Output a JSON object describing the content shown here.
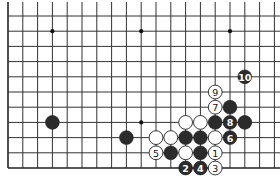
{
  "diagram": {
    "type": "go-board-partial",
    "visible_columns": 19,
    "visible_rows": 11,
    "edges": [
      "left",
      "bottom"
    ],
    "colors": {
      "black_stone": "#2b2b2b",
      "white_stone": "#ffffff",
      "grid": "#333333",
      "background": "#ffffff"
    },
    "star_points": [
      {
        "col": 3,
        "row": 1
      },
      {
        "col": 9,
        "row": 1
      },
      {
        "col": 15,
        "row": 1
      },
      {
        "col": 9,
        "row": 7
      }
    ],
    "stones": [
      {
        "color": "black",
        "col": 3,
        "row": 7,
        "label": ""
      },
      {
        "color": "black",
        "col": 8,
        "row": 8,
        "label": ""
      },
      {
        "color": "black",
        "col": 16,
        "row": 4,
        "label": "10"
      },
      {
        "color": "white",
        "col": 14,
        "row": 5,
        "label": "9"
      },
      {
        "color": "white",
        "col": 14,
        "row": 6,
        "label": "7"
      },
      {
        "color": "black",
        "col": 15,
        "row": 6,
        "label": ""
      },
      {
        "color": "white",
        "col": 12,
        "row": 7,
        "label": ""
      },
      {
        "color": "white",
        "col": 13,
        "row": 7,
        "label": ""
      },
      {
        "color": "black",
        "col": 14,
        "row": 7,
        "label": ""
      },
      {
        "color": "black",
        "col": 15,
        "row": 7,
        "label": "8"
      },
      {
        "color": "black",
        "col": 16,
        "row": 7,
        "label": ""
      },
      {
        "color": "white",
        "col": 10,
        "row": 8,
        "label": ""
      },
      {
        "color": "white",
        "col": 11,
        "row": 8,
        "label": ""
      },
      {
        "color": "black",
        "col": 12,
        "row": 8,
        "label": ""
      },
      {
        "color": "black",
        "col": 13,
        "row": 8,
        "label": ""
      },
      {
        "color": "white",
        "col": 14,
        "row": 8,
        "label": ""
      },
      {
        "color": "black",
        "col": 15,
        "row": 8,
        "label": "6"
      },
      {
        "color": "white",
        "col": 10,
        "row": 9,
        "label": "5"
      },
      {
        "color": "black",
        "col": 11,
        "row": 9,
        "label": ""
      },
      {
        "color": "white",
        "col": 12,
        "row": 9,
        "label": ""
      },
      {
        "color": "black",
        "col": 13,
        "row": 9,
        "label": ""
      },
      {
        "color": "white",
        "col": 14,
        "row": 9,
        "label": "1"
      },
      {
        "color": "black",
        "col": 12,
        "row": 10,
        "label": "2"
      },
      {
        "color": "black",
        "col": 13,
        "row": 10,
        "label": "4"
      },
      {
        "color": "white",
        "col": 14,
        "row": 10,
        "label": "3"
      }
    ]
  }
}
